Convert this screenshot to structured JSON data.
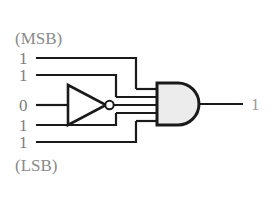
{
  "diagram": {
    "background_color": "#ffffff",
    "wire_color": "#1a1a1a",
    "gate_fill": "#eeeeee",
    "label_color": "#8a8a8a",
    "labels": {
      "msb": "(MSB)",
      "lsb": "(LSB)"
    },
    "inputs": [
      {
        "name": "input-bit-1",
        "value": "1",
        "inverted": "false"
      },
      {
        "name": "input-bit-2",
        "value": "1",
        "inverted": "false"
      },
      {
        "name": "input-bit-3",
        "value": "0",
        "inverted": "true"
      },
      {
        "name": "input-bit-4",
        "value": "1",
        "inverted": "false"
      },
      {
        "name": "input-bit-5",
        "value": "1",
        "inverted": "false"
      }
    ],
    "gates": [
      {
        "name": "not-gate",
        "type": "NOT",
        "label": ""
      },
      {
        "name": "and-gate",
        "type": "AND",
        "label": ""
      }
    ],
    "output": {
      "name": "output-value",
      "value": "1"
    }
  }
}
